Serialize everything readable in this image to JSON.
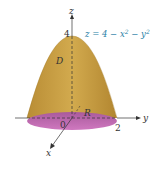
{
  "diagram": {
    "equation": "z = 4 − x² − y²",
    "equation_parts": {
      "lhs": "z",
      "eq": " = 4 − x",
      "sup1": "2",
      "mid": " − y",
      "sup2": "2"
    },
    "axes": {
      "z": "z",
      "y": "y",
      "x": "x"
    },
    "labels": {
      "solid": "D",
      "region": "R",
      "origin": "0",
      "z_tick": "4",
      "y_tick": "2"
    },
    "colors": {
      "surface": "#c9a040",
      "surface_dark": "#a9802a",
      "base": "#c166b0",
      "base_dark": "#9c4e90",
      "axis": "#333333",
      "equation": "#2a7fa6"
    }
  }
}
